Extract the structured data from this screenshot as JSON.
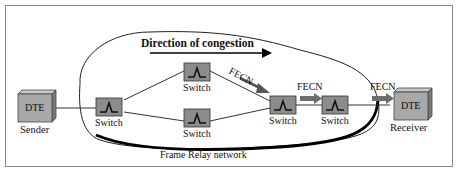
{
  "diagram": {
    "direction_label": "Direction of congestion",
    "network_label": "Frame Relay network",
    "sender": {
      "box": "DTE",
      "caption": "Sender"
    },
    "receiver": {
      "box": "DTE",
      "caption": "Receiver"
    },
    "switches": [
      {
        "id": "sw1",
        "label": "Switch"
      },
      {
        "id": "sw2",
        "label": "Switch"
      },
      {
        "id": "sw3",
        "label": "Switch"
      },
      {
        "id": "sw4",
        "label": "Switch"
      },
      {
        "id": "sw5",
        "label": "Switch"
      }
    ],
    "fecn_labels": [
      {
        "id": "fecn1",
        "label": "FECN"
      },
      {
        "id": "fecn2",
        "label": "FECN"
      },
      {
        "id": "fecn3",
        "label": "FECN"
      }
    ],
    "colors": {
      "switch_fill": "#8c8c8c",
      "dte_fill": "#a8a8a8",
      "arrow_fill": "#6e6e6e",
      "line": "#333333"
    }
  }
}
